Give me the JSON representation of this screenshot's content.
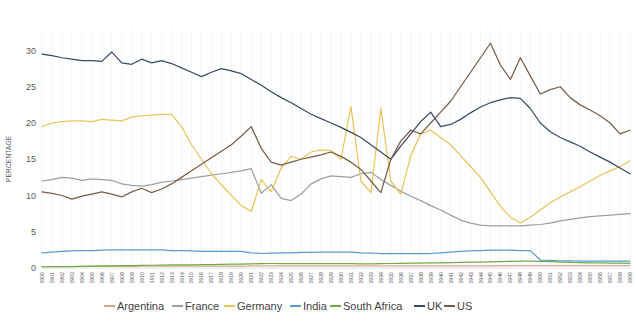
{
  "chart_data": {
    "type": "line",
    "title": "",
    "xlabel": "",
    "ylabel": "PERCENTAGE",
    "ylim": [
      0,
      32
    ],
    "yticks": [
      0,
      5,
      10,
      15,
      20,
      25,
      30
    ],
    "ytick_labels": [
      "0",
      "5",
      "10",
      "15",
      "20",
      "25",
      "30"
    ],
    "grid": true,
    "legend_position": "bottom",
    "x": [
      1900,
      1901,
      1902,
      1903,
      1904,
      1905,
      1906,
      1907,
      1908,
      1909,
      1910,
      1911,
      1912,
      1913,
      1914,
      1915,
      1916,
      1917,
      1918,
      1919,
      1920,
      1921,
      1922,
      1923,
      1924,
      1925,
      1926,
      1927,
      1928,
      1929,
      1930,
      1931,
      1932,
      1933,
      1934,
      1935,
      1936,
      1937,
      1938,
      1939,
      1940,
      1941,
      1942,
      1943,
      1944,
      1945,
      1946,
      1947,
      1948,
      1949,
      1950,
      1951,
      1952,
      1953,
      1954,
      1955,
      1956,
      1957,
      1958,
      1959
    ],
    "xtick_labels": [
      "1900",
      "1901",
      "1902",
      "1903",
      "1904",
      "1905",
      "1906",
      "1907",
      "1908",
      "1909",
      "1910",
      "1911",
      "1912",
      "1913",
      "1914",
      "1915",
      "1916",
      "1917",
      "1918",
      "1919",
      "1920",
      "1921",
      "1922",
      "1923",
      "1924",
      "1925",
      "1926",
      "1927",
      "1928",
      "1929",
      "1930",
      "1931",
      "1932",
      "1933",
      "1934",
      "1935",
      "1936",
      "1937",
      "1938",
      "1939",
      "1940",
      "1941",
      "1942",
      "1943",
      "1944",
      "1945",
      "1946",
      "1947",
      "1948",
      "1949",
      "1950",
      "1951",
      "1952",
      "1953",
      "1954",
      "1955",
      "1956",
      "1957",
      "1958",
      "1959"
    ],
    "series": [
      {
        "name": "Argentina",
        "color": "#d9a98a",
        "values": [
          0.2,
          0.2,
          0.2,
          0.2,
          0.22,
          0.22,
          0.22,
          0.22,
          0.24,
          0.24,
          0.25,
          0.25,
          0.25,
          0.26,
          0.26,
          0.26,
          0.26,
          0.26,
          0.26,
          0.27,
          0.27,
          0.28,
          0.28,
          0.28,
          0.28,
          0.28,
          0.28,
          0.28,
          0.28,
          0.3,
          0.3,
          0.3,
          0.3,
          0.3,
          0.3,
          0.3,
          0.3,
          0.3,
          0.3,
          0.3,
          0.3,
          0.3,
          0.3,
          0.3,
          0.3,
          0.3,
          0.32,
          0.34,
          0.34,
          0.34,
          0.34,
          0.34,
          0.34,
          0.34,
          0.34,
          0.34,
          0.34,
          0.34,
          0.34,
          0.34
        ]
      },
      {
        "name": "France",
        "color": "#9aa0a6",
        "values": [
          12.0,
          12.2,
          12.5,
          12.4,
          12.1,
          12.3,
          12.2,
          12.1,
          11.6,
          11.4,
          11.3,
          11.5,
          11.8,
          12.0,
          12.2,
          12.4,
          12.6,
          12.8,
          13.0,
          13.2,
          13.4,
          13.7,
          10.3,
          11.5,
          9.6,
          9.3,
          10.2,
          11.6,
          12.3,
          12.7,
          12.6,
          12.5,
          13.0,
          13.2,
          12.2,
          11.4,
          10.6,
          9.9,
          9.3,
          8.6,
          8.0,
          7.3,
          6.6,
          6.2,
          5.9,
          5.8,
          5.8,
          5.8,
          5.8,
          5.9,
          6.0,
          6.2,
          6.5,
          6.7,
          6.9,
          7.1,
          7.2,
          7.3,
          7.4,
          7.5
        ]
      },
      {
        "name": "Germany",
        "color": "#e8c55a",
        "values": [
          19.5,
          20.0,
          20.2,
          20.3,
          20.3,
          20.2,
          20.5,
          20.4,
          20.3,
          20.8,
          21.0,
          21.1,
          21.2,
          21.2,
          19.5,
          17.0,
          15.0,
          13.0,
          11.5,
          10.0,
          8.6,
          7.8,
          12.2,
          10.5,
          13.8,
          15.4,
          15.0,
          16.0,
          16.3,
          16.2,
          15.0,
          22.3,
          12.0,
          10.4,
          22.0,
          12.0,
          10.2,
          15.5,
          18.5,
          19.0,
          18.0,
          17.0,
          15.5,
          14.0,
          12.5,
          10.5,
          8.5,
          7.0,
          6.2,
          7.0,
          8.0,
          9.0,
          9.8,
          10.5,
          11.2,
          12.0,
          12.8,
          13.4,
          14.0,
          14.8
        ]
      },
      {
        "name": "India",
        "color": "#5b9bd5",
        "values": [
          2.1,
          2.2,
          2.3,
          2.35,
          2.4,
          2.4,
          2.45,
          2.5,
          2.5,
          2.5,
          2.5,
          2.5,
          2.5,
          2.4,
          2.4,
          2.35,
          2.3,
          2.3,
          2.3,
          2.3,
          2.3,
          2.1,
          2.0,
          2.05,
          2.1,
          2.1,
          2.15,
          2.15,
          2.2,
          2.2,
          2.2,
          2.2,
          2.1,
          2.05,
          2.0,
          2.0,
          2.0,
          2.0,
          2.0,
          2.0,
          2.1,
          2.2,
          2.3,
          2.35,
          2.4,
          2.45,
          2.45,
          2.45,
          2.4,
          2.4,
          1.1,
          1.05,
          1.0,
          1.0,
          0.95,
          0.95,
          0.95,
          0.95,
          0.95,
          0.95
        ]
      },
      {
        "name": "South Africa",
        "color": "#70ad47",
        "values": [
          0.15,
          0.15,
          0.18,
          0.2,
          0.22,
          0.25,
          0.28,
          0.3,
          0.32,
          0.34,
          0.36,
          0.38,
          0.4,
          0.42,
          0.42,
          0.44,
          0.46,
          0.48,
          0.5,
          0.52,
          0.55,
          0.58,
          0.6,
          0.62,
          0.62,
          0.62,
          0.62,
          0.62,
          0.62,
          0.62,
          0.62,
          0.6,
          0.58,
          0.58,
          0.6,
          0.62,
          0.64,
          0.66,
          0.68,
          0.7,
          0.72,
          0.75,
          0.78,
          0.8,
          0.82,
          0.85,
          0.88,
          0.92,
          0.95,
          0.95,
          0.92,
          0.88,
          0.82,
          0.78,
          0.75,
          0.72,
          0.7,
          0.68,
          0.66,
          0.65
        ]
      },
      {
        "name": "UK",
        "color": "#3b4a66",
        "values": [
          29.5,
          29.3,
          29.0,
          28.8,
          28.6,
          28.6,
          28.5,
          29.8,
          28.3,
          28.1,
          28.8,
          28.3,
          28.6,
          28.2,
          27.6,
          27.0,
          26.4,
          27.0,
          27.5,
          27.2,
          26.8,
          26.0,
          25.2,
          24.3,
          23.5,
          22.8,
          22.0,
          21.2,
          20.6,
          20.0,
          19.4,
          18.7,
          18.0,
          17.0,
          16.0,
          15.0,
          16.8,
          18.5,
          20.2,
          21.5,
          19.5,
          19.8,
          20.5,
          21.4,
          22.2,
          22.8,
          23.2,
          23.5,
          23.4,
          22.0,
          20.0,
          18.8,
          18.0,
          17.4,
          16.8,
          16.0,
          15.3,
          14.6,
          13.8,
          13.0
        ]
      },
      {
        "name": "US",
        "color": "#7b5d46",
        "values": [
          10.5,
          10.3,
          10.0,
          9.5,
          9.9,
          10.2,
          10.5,
          10.2,
          9.8,
          10.5,
          11.0,
          10.4,
          10.9,
          11.6,
          12.5,
          13.4,
          14.3,
          15.2,
          16.1,
          17.0,
          18.2,
          19.5,
          16.5,
          14.6,
          14.2,
          14.6,
          15.0,
          15.3,
          15.6,
          16.0,
          15.4,
          14.6,
          13.6,
          12.0,
          10.4,
          15.0,
          17.5,
          19.0,
          18.5,
          20.0,
          21.5,
          23.0,
          25.0,
          27.0,
          29.0,
          31.0,
          28.0,
          26.0,
          29.0,
          26.5,
          24.0,
          24.6,
          25.0,
          23.5,
          22.5,
          21.8,
          21.0,
          20.0,
          18.5,
          19.0
        ]
      }
    ]
  },
  "axis": {
    "y_title": "PERCENTAGE"
  },
  "legend": {
    "items": [
      {
        "label": "Argentina",
        "color": "#d9a98a"
      },
      {
        "label": "France",
        "color": "#9aa0a6"
      },
      {
        "label": "Germany",
        "color": "#e8c55a"
      },
      {
        "label": "India",
        "color": "#5b9bd5"
      },
      {
        "label": "South Africa",
        "color": "#70ad47"
      },
      {
        "label": "UK",
        "color": "#3b4a66"
      },
      {
        "label": "US",
        "color": "#7b5d46"
      }
    ]
  }
}
